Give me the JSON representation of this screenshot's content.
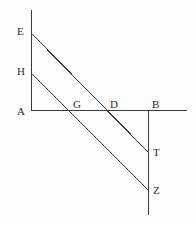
{
  "figure": {
    "background_color": "#fdfdfd",
    "stroke_color": "#3a3a3a",
    "label_color": "#2b2b2b",
    "width": 196,
    "height": 225
  },
  "segments": [
    {
      "name": "vertical-axis-left",
      "from": "E-top",
      "to": "A",
      "x1": 31,
      "y1": 10,
      "x2": 31,
      "y2": 111
    },
    {
      "name": "horizontal-axis",
      "from": "A",
      "to": "right-end",
      "x1": 31,
      "y1": 110.5,
      "x2": 187,
      "y2": 110.5
    },
    {
      "name": "vertical-axis-right",
      "from": "B",
      "to": "bottom-end",
      "x1": 148,
      "y1": 110,
      "x2": 148,
      "y2": 215
    },
    {
      "name": "transversal-E-T",
      "from": "E",
      "to": "T",
      "x1": 31,
      "y1": 33,
      "x2": 148,
      "y2": 152
    },
    {
      "name": "transversal-H-Z",
      "from": "H",
      "to": "Z",
      "x1": 31,
      "y1": 73,
      "x2": 148,
      "y2": 190
    }
  ],
  "labels": [
    {
      "id": "E",
      "text": "E",
      "x": 17,
      "y": 26
    },
    {
      "id": "H",
      "text": "H",
      "x": 17,
      "y": 66
    },
    {
      "id": "A",
      "text": "A",
      "x": 17,
      "y": 106
    },
    {
      "id": "G",
      "text": "G",
      "x": 73,
      "y": 99
    },
    {
      "id": "D",
      "text": "D",
      "x": 110,
      "y": 99
    },
    {
      "id": "B",
      "text": "B",
      "x": 152,
      "y": 99
    },
    {
      "id": "T",
      "text": "T",
      "x": 153,
      "y": 147
    },
    {
      "id": "Z",
      "text": "Z",
      "x": 153,
      "y": 185
    }
  ]
}
